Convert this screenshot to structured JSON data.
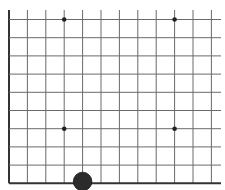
{
  "board": {
    "type": "go-board-corner",
    "corner": "bottom-left",
    "background_color": "#ffffff",
    "line_color": "#6a6a6a",
    "edge_color": "#333333",
    "columns_visible": 12,
    "rows_visible": 10,
    "vertical_lines_x": [
      9,
      27.4,
      45.8,
      64.2,
      82.6,
      101,
      119.4,
      137.8,
      156.2,
      174.6,
      193,
      211.4
    ],
    "horizontal_lines_y": [
      19.5,
      37.7,
      55.9,
      74.1,
      92.3,
      110.5,
      128.7,
      146.9,
      165.1,
      183.3
    ],
    "line_top": 10,
    "line_right": 221,
    "star_points": [
      {
        "x": 64.2,
        "y": 19.5
      },
      {
        "x": 174.6,
        "y": 19.5
      },
      {
        "x": 64.2,
        "y": 128.7
      },
      {
        "x": 174.6,
        "y": 128.7
      }
    ],
    "stones": [
      {
        "color": "black",
        "x": 82.6,
        "y": 181.5,
        "radius": 9.3,
        "fill": "#2b2b2b"
      }
    ]
  }
}
